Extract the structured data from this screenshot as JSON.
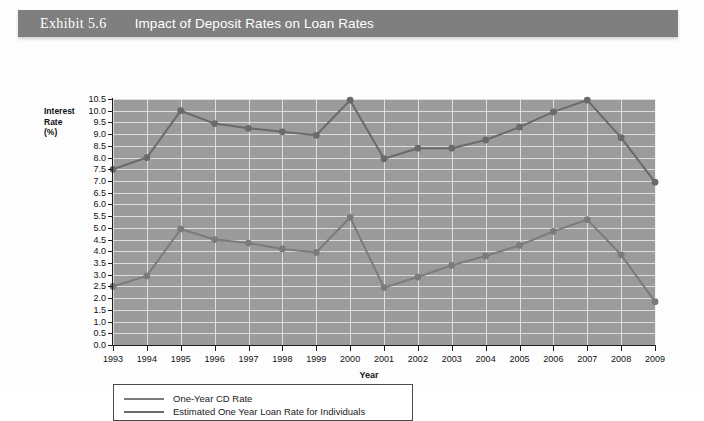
{
  "exhibit": {
    "label": "Exhibit 5.6",
    "title": "Impact of Deposit Rates on Loan Rates"
  },
  "colors": {
    "header_bar": "#7f7f7f",
    "plot_background": "#9b9b9b",
    "gridline": "#e8e8e8",
    "axis": "#1d1d1d",
    "cd_rate_line": "#7b7b7b",
    "loan_rate_line": "#6a6a6a",
    "legend_border": "#4a4a4a"
  },
  "chart_data": {
    "type": "line",
    "title": "Impact of Deposit Rates on Loan Rates",
    "xlabel": "Year",
    "ylabel": "Interest Rate (%)",
    "ylabel_lines": [
      "Interest",
      "Rate",
      "(%)"
    ],
    "grid": true,
    "legend_position": "bottom-left",
    "xlim": [
      1993,
      2009
    ],
    "ylim": [
      0.0,
      10.5
    ],
    "ytick_step": 0.5,
    "yticks": [
      "10.5",
      "10.0",
      "9.5",
      "9.0",
      "8.5",
      "8.0",
      "7.5",
      "7.0",
      "6.5",
      "6.0",
      "5.5",
      "5.0",
      "4.5",
      "4.0",
      "3.5",
      "3.0",
      "2.5",
      "2.0",
      "1.5",
      "1.0",
      "0.5",
      "0.0"
    ],
    "categories": [
      1993,
      1994,
      1995,
      1996,
      1997,
      1998,
      1999,
      2000,
      2001,
      2002,
      2003,
      2004,
      2005,
      2006,
      2007,
      2008,
      2009
    ],
    "xticks": [
      "1993",
      "1994",
      "1995",
      "1996",
      "1997",
      "1998",
      "1999",
      "2000",
      "2001",
      "2002",
      "2003",
      "2004",
      "2005",
      "2006",
      "2007",
      "2008",
      "2009"
    ],
    "series": [
      {
        "name": "One-Year CD Rate",
        "color": "#7b7b7b",
        "values": [
          2.5,
          2.95,
          4.95,
          4.5,
          4.35,
          4.1,
          3.95,
          5.45,
          2.45,
          2.9,
          3.4,
          3.8,
          4.25,
          4.85,
          5.35,
          3.85,
          1.85
        ]
      },
      {
        "name": "Estimated One Year Loan Rate for Individuals",
        "color": "#6a6a6a",
        "values": [
          7.5,
          8.0,
          10.0,
          9.45,
          9.25,
          9.1,
          8.95,
          10.45,
          7.95,
          8.4,
          8.4,
          8.75,
          9.3,
          9.95,
          10.45,
          8.85,
          6.95
        ]
      }
    ]
  }
}
